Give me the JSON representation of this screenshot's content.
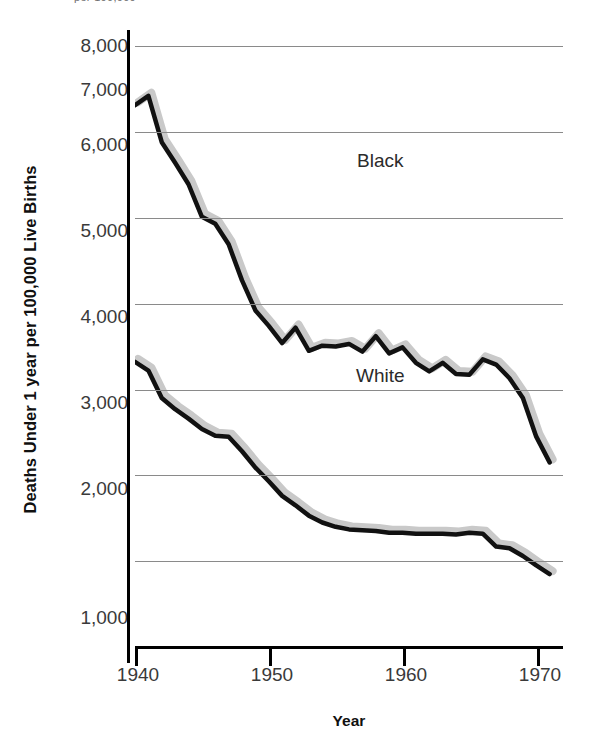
{
  "figure": {
    "top_clipped_fragment": "per 100,000",
    "background_color": "#ffffff"
  },
  "axes": {
    "y_title": "Deaths Under 1 year per 100,000 Live Births",
    "x_title": "Year",
    "y_ticks": [
      "1,000",
      "2,000",
      "3,000",
      "4,000",
      "5,000",
      "6,000",
      "7,000",
      "8,000"
    ],
    "x_ticks": [
      "1940",
      "1950",
      "1960",
      "1970"
    ],
    "grid_color": "#8a8a8a",
    "axis_color": "#000000"
  },
  "annotations": {
    "black_label": "Black",
    "white_label": "White"
  },
  "chart_data": {
    "type": "line",
    "title": "",
    "subtitle": "",
    "xlabel": "Year",
    "ylabel": "Deaths Under 1 year per 100,000 Live Births",
    "xlim": [
      1940,
      1972
    ],
    "ylim": [
      1000,
      8000
    ],
    "xticks": [
      1940,
      1950,
      1960,
      1970
    ],
    "yticks": [
      1000,
      2000,
      3000,
      4000,
      5000,
      6000,
      7000,
      8000
    ],
    "grid": "horizontal",
    "legend": "inline-annotations",
    "line_color": "#111111",
    "shadow_color": "#c9c9c9",
    "x": [
      1940,
      1941,
      1942,
      1943,
      1944,
      1945,
      1946,
      1947,
      1948,
      1949,
      1950,
      1951,
      1952,
      1953,
      1954,
      1955,
      1956,
      1957,
      1958,
      1959,
      1960,
      1961,
      1962,
      1963,
      1964,
      1965,
      1966,
      1967,
      1968,
      1969,
      1970,
      1971
    ],
    "series": [
      {
        "name": "Black",
        "values": [
          7310,
          7420,
          6880,
          6640,
          6390,
          6010,
          5930,
          5690,
          5270,
          4920,
          4740,
          4540,
          4720,
          4450,
          4510,
          4500,
          4530,
          4440,
          4620,
          4420,
          4490,
          4310,
          4210,
          4310,
          4180,
          4170,
          4350,
          4290,
          4130,
          3900,
          3450,
          3150
        ]
      },
      {
        "name": "White",
        "values": [
          4320,
          4220,
          3900,
          3770,
          3660,
          3540,
          3460,
          3450,
          3280,
          3090,
          2930,
          2760,
          2650,
          2530,
          2450,
          2400,
          2370,
          2360,
          2350,
          2330,
          2330,
          2320,
          2320,
          2320,
          2310,
          2330,
          2320,
          2170,
          2150,
          2060,
          1950,
          1850
        ]
      }
    ]
  }
}
